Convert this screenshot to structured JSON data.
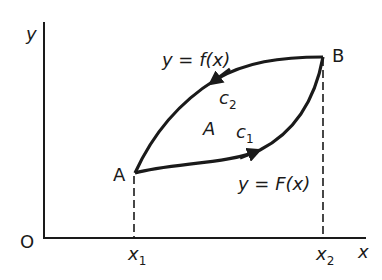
{
  "diagram": {
    "axes": {
      "y_label": "y",
      "x_label": "x",
      "origin_label": "O"
    },
    "points": {
      "A": {
        "label": "A"
      },
      "B": {
        "label": "B"
      }
    },
    "ticks": {
      "x1": {
        "base": "x",
        "sub": "1"
      },
      "x2": {
        "base": "x",
        "sub": "2"
      }
    },
    "curves": {
      "upper": {
        "equation": "y = f(x)",
        "contour": {
          "base": "c",
          "sub": "2"
        }
      },
      "lower": {
        "equation": "y = F(x)",
        "contour": {
          "base": "c",
          "sub": "1"
        }
      }
    },
    "region_label": "A",
    "colors": {
      "stroke": "#1a1a1a",
      "background": "#ffffff"
    }
  }
}
